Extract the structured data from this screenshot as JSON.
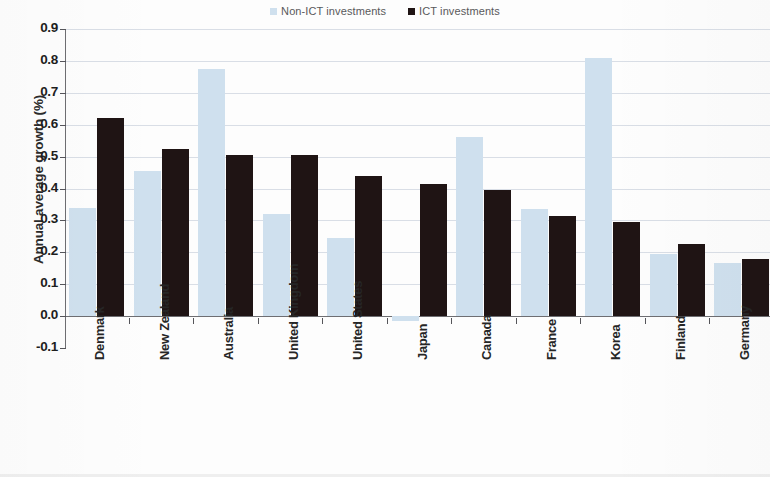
{
  "legend": {
    "entries": [
      {
        "label": "Non-ICT investments",
        "color": "#cfe0ee",
        "icon": "square-swatch-icon"
      },
      {
        "label": "ICT investments",
        "color": "#1f1414",
        "icon": "square-swatch-icon"
      }
    ]
  },
  "axes": {
    "y_title": "Annual average growth (%)",
    "y_ticks": [
      "0.9",
      "0.8",
      "0.7",
      "0.6",
      "0.5",
      "0.4",
      "0.3",
      "0.2",
      "0.1",
      "0.0",
      "-0.1"
    ]
  },
  "chart_data": {
    "type": "bar",
    "title": "",
    "xlabel": "",
    "ylabel": "Annual average growth (%)",
    "ylim": [
      -0.1,
      0.9
    ],
    "ytick_step": 0.1,
    "grid": true,
    "legend_position": "top-center",
    "categories": [
      "Denmark",
      "New Zealand",
      "Australia",
      "United Kingdom",
      "United States",
      "Japan",
      "Canada",
      "France",
      "Korea",
      "Finland",
      "Germany"
    ],
    "series": [
      {
        "name": "Non-ICT investments",
        "color": "#cfe0ee",
        "values": [
          0.34,
          0.455,
          0.775,
          0.32,
          0.245,
          -0.015,
          0.56,
          0.335,
          0.81,
          0.195,
          0.165
        ]
      },
      {
        "name": "ICT investments",
        "color": "#1f1414",
        "values": [
          0.62,
          0.525,
          0.505,
          0.505,
          0.44,
          0.415,
          0.395,
          0.315,
          0.295,
          0.225,
          0.18
        ]
      }
    ]
  }
}
